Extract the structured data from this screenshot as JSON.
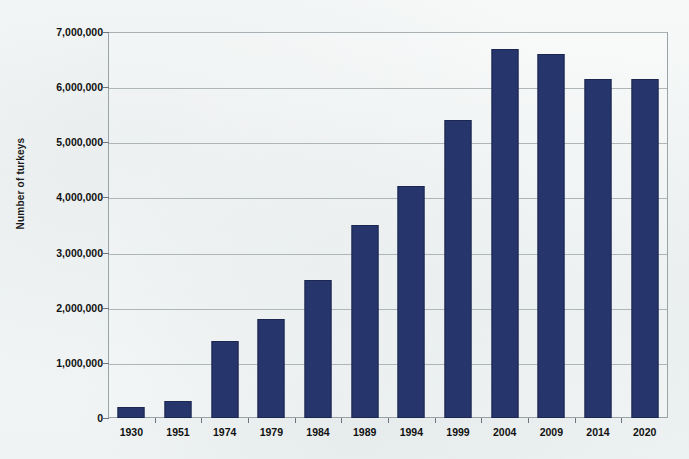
{
  "chart_data": {
    "type": "bar",
    "title": "",
    "xlabel": "",
    "ylabel": "Number of turkeys",
    "ylim": [
      0,
      7000000
    ],
    "grid": true,
    "legend": "none",
    "categories": [
      "1930",
      "1951",
      "1974",
      "1979",
      "1984",
      "1989",
      "1994",
      "1999",
      "2004",
      "2009",
      "2014",
      "2020"
    ],
    "values": [
      200000,
      300000,
      1400000,
      1800000,
      2500000,
      3500000,
      4200000,
      5400000,
      6700000,
      6600000,
      6150000,
      6150000
    ],
    "ytick_labels": [
      "7,000,000",
      "6,000,000",
      "5,000,000",
      "4,000,000",
      "3,000,000",
      "2,000,000",
      "1,000,000",
      "0"
    ],
    "ytick_values": [
      7000000,
      6000000,
      5000000,
      4000000,
      3000000,
      2000000,
      1000000,
      0
    ],
    "series": [
      {
        "name": "Number of turkeys",
        "color": "#26356B",
        "values": [
          200000,
          300000,
          1400000,
          1800000,
          2500000,
          3500000,
          4200000,
          5400000,
          6700000,
          6600000,
          6150000,
          6150000
        ]
      }
    ]
  },
  "colors": {
    "bar": "#26356B",
    "bar_border": "#1B2750",
    "gridline": "#AEB6B8",
    "axis": "#9AA3A6",
    "text": "#111111",
    "background": "#F4F6F6"
  },
  "axis": {
    "y_title": "Number of turkeys"
  },
  "title_sliver": "Number of turkeys"
}
